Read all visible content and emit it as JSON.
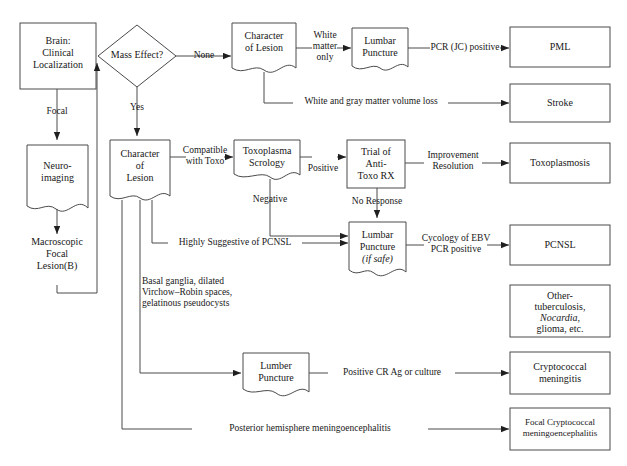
{
  "diagram": {
    "stroke_color": "#4a4a4a",
    "text_color": "#181818",
    "background": "#ffffff"
  },
  "nodes": {
    "brain": {
      "label": "Brain:\nClinical\nLocalization",
      "shape": "rect"
    },
    "neuroimaging": {
      "label": "Neuro-\nimaging",
      "shape": "document"
    },
    "macroscopic": {
      "label": "Macroscopic\nFocal\nLesion(B)",
      "shape": "text"
    },
    "mass_effect": {
      "label": "Mass Effect?",
      "shape": "diamond"
    },
    "character_top": {
      "label": "Character\nof Lesion",
      "shape": "document"
    },
    "character_mid": {
      "label": "Character\nof\nLesion",
      "shape": "document"
    },
    "lumbar_top": {
      "label": "Lumbar\nPuncture",
      "shape": "document"
    },
    "toxo_serology": {
      "label": "Toxoplasma\nScrology",
      "shape": "document"
    },
    "trial_anti_toxo": {
      "label": "Trial of\nAnti-\nToxo RX",
      "shape": "rect"
    },
    "lumbar_if_safe": {
      "label": "Lumbar\nPuncture",
      "sublabel": "(if safe)",
      "shape": "document"
    },
    "lumber_puncture_bottom": {
      "label": "Lumber\nPuncture",
      "shape": "document"
    }
  },
  "outcomes": {
    "pml": {
      "label": "PML"
    },
    "stroke": {
      "label": "Stroke"
    },
    "toxoplasmosis": {
      "label": "Toxoplasmosis"
    },
    "pcnsl": {
      "label": "PCNSL"
    },
    "other": {
      "label_line1": "Other-",
      "label_line2": "tuberculosis,",
      "label_line3": "Nocardia,",
      "label_line4": "glioma, etc."
    },
    "cryptococcal_meningitis": {
      "label": "Cryptococcal\nmeningitis"
    },
    "focal_cryptococcal": {
      "label": "Focal Cryptococcal\nmeningoencephalitis"
    }
  },
  "edge_labels": {
    "focal": "Focal",
    "none": "None",
    "yes": "Yes",
    "white_matter_only": "White\nmatter\nonly",
    "pcr_jc_positive": "PCR (JC) positive",
    "white_gray_volume_loss": "White and gray matter volume loss",
    "compatible_with_toxo": "Compatible\nwith Toxo",
    "positive": "Positive",
    "negative": "Negative",
    "improvement_resolution": "Improvement\nResolution",
    "no_response": "No Response",
    "highly_suggestive": "Highly Suggestive of PCNSL",
    "cycology_ebv": "Cycology of EBV\nPCR positive",
    "positive_cr_ag": "Positive CR Ag or culture",
    "posterior_hemisphere": "Posterior hemisphere meningoencephalitis"
  },
  "annotations": {
    "basal_ganglia": "Basal ganglia, dilated\nVirchow–Robin spaces,\ngelatinous pseudocysts"
  }
}
